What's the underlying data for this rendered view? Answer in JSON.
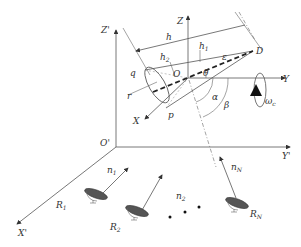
{
  "diagram": {
    "labels": {
      "Z_prime": "Z'",
      "Z": "Z",
      "h": "h",
      "h1": "h",
      "h1_sub": "1",
      "h2": "h",
      "h2_sub": "2",
      "D": "D",
      "q": "q",
      "O": "O",
      "r": "r",
      "p": "p",
      "X": "X",
      "Y": "Y",
      "epsilon": "ε",
      "theta": "θ",
      "alpha": "α",
      "beta": "β",
      "omega": "ω",
      "omega_sub": "c",
      "O_prime": "O'",
      "Y_prime": "Y'",
      "X_prime": "X'",
      "n1": "n",
      "n1_sub": "1",
      "n2": "n",
      "n2_sub": "2",
      "nN": "n",
      "nN_sub": "N",
      "R1": "R",
      "R1_sub": "1",
      "R2": "R",
      "R2_sub": "2",
      "RN": "R",
      "RN_sub": "N"
    },
    "radars": [
      {
        "name": "R1",
        "line_of_sight": "n1"
      },
      {
        "name": "R2",
        "line_of_sight": "n2"
      },
      {
        "name": "RN",
        "line_of_sight": "nN"
      }
    ],
    "colors": {
      "line": "#555555",
      "text": "#333333",
      "fill_dark": "#444444"
    }
  }
}
